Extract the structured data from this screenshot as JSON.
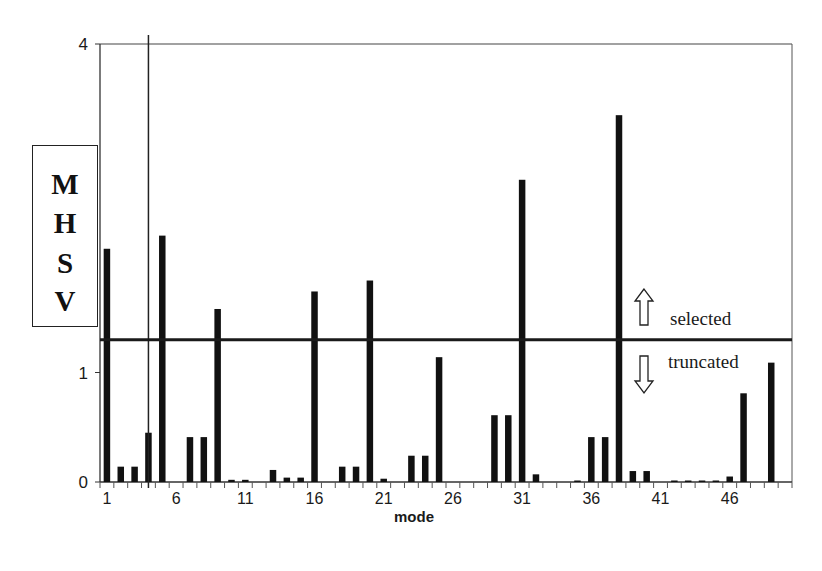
{
  "chart_data": {
    "type": "bar",
    "title": "",
    "xlabel": "mode",
    "ylabel": "MHSV",
    "ylim": [
      0,
      4
    ],
    "yticks": [
      0,
      1,
      4
    ],
    "xtick_labels": [
      "1",
      "6",
      "11",
      "16",
      "21",
      "26",
      "31",
      "36",
      "41",
      "46"
    ],
    "grid": false,
    "legend": null,
    "categories": [
      1,
      2,
      3,
      4,
      5,
      6,
      7,
      8,
      9,
      10,
      11,
      12,
      13,
      14,
      15,
      16,
      17,
      18,
      19,
      20,
      21,
      22,
      23,
      24,
      25,
      26,
      27,
      28,
      29,
      30,
      31,
      32,
      33,
      34,
      35,
      36,
      37,
      38,
      39,
      40,
      41,
      42,
      43,
      44,
      45,
      46,
      47,
      48,
      49,
      50
    ],
    "values": [
      2.13,
      0.14,
      0.14,
      0.45,
      2.25,
      0.0,
      0.41,
      0.41,
      1.58,
      0.02,
      0.02,
      0.0,
      0.11,
      0.04,
      0.04,
      1.74,
      0.0,
      0.14,
      0.14,
      1.84,
      0.03,
      0.0,
      0.24,
      0.24,
      1.14,
      0.0,
      0.0,
      0.0,
      0.61,
      0.61,
      2.76,
      0.07,
      0.0,
      0.0,
      0.005,
      0.41,
      0.41,
      3.35,
      0.1,
      0.1,
      0.0,
      0.01,
      0.01,
      0.005,
      0.005,
      0.05,
      0.81,
      0.0,
      1.09,
      0.0
    ],
    "threshold": {
      "value": 1.3,
      "above_label": "selected",
      "below_label": "truncated"
    },
    "reference_vline_mode": 3.5
  },
  "axis": {
    "y_tick_labels": [
      "0",
      "1",
      "4"
    ],
    "x_label": "mode",
    "y_label_letters": [
      "M",
      "H",
      "S",
      "V"
    ]
  },
  "annotations": {
    "selected": "selected",
    "truncated": "truncated",
    "up_arrow": "up-arrow",
    "down_arrow": "down-arrow"
  },
  "colors": {
    "bar": "#111111",
    "axis": "#333333",
    "background": "#ffffff"
  }
}
